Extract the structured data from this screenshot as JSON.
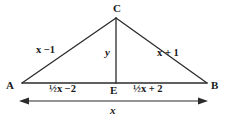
{
  "figure": {
    "type": "geometry-diagram",
    "stroke_color": "#2b2b2b",
    "background_color": "#ffffff",
    "vertices": {
      "A": "A",
      "B": "B",
      "C": "C",
      "E": "E"
    },
    "labels": {
      "left_side": "x −1",
      "right_side": "x + 1",
      "altitude": "y",
      "base_left_segment": "½x −2",
      "base_right_segment": "½x + 2",
      "base_total": "x"
    },
    "geometry": {
      "apex": [
        116,
        18
      ],
      "base_left": [
        22,
        83
      ],
      "base_right": [
        207,
        83
      ],
      "foot": [
        116,
        83
      ],
      "dimension_line_y": 101,
      "dimension_left_x": 20,
      "dimension_right_x": 207
    }
  }
}
